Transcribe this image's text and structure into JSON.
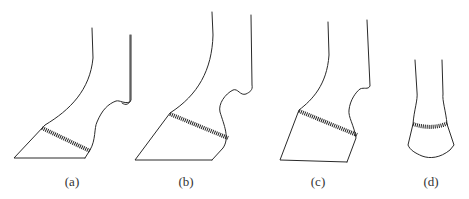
{
  "figure": {
    "panels": [
      {
        "id": "a",
        "label": "(a)",
        "label_x": 72
      },
      {
        "id": "b",
        "label": "(b)",
        "label_x": 186
      },
      {
        "id": "c",
        "label": "(c)",
        "label_x": 318
      },
      {
        "id": "d",
        "label": "(d)",
        "label_x": 431
      }
    ],
    "colors": {
      "line": "#2a2a2a",
      "background": "#ffffff"
    }
  }
}
